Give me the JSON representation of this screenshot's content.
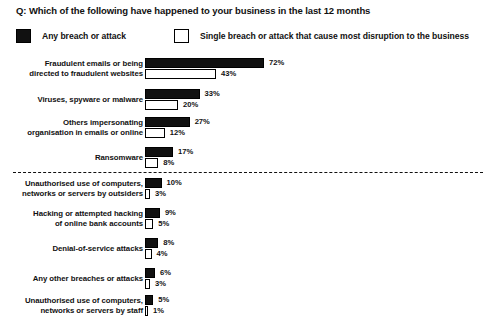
{
  "chart_data": {
    "type": "bar",
    "orientation": "horizontal",
    "title": "Q: Which of the following have happened to your business in the last 12 months",
    "xlabel": "",
    "ylabel": "",
    "xlim": [
      0,
      75
    ],
    "grid": false,
    "legend_position": "top",
    "value_suffix": "%",
    "legend": [
      {
        "label": "Any breach or attack",
        "swatch": "filled",
        "color": "#111111"
      },
      {
        "label": "Single breach or attack that cause most disruption to the business",
        "swatch": "hollow",
        "color": "#ffffff"
      }
    ],
    "series": [
      {
        "name": "Any breach or attack",
        "values": [
          72,
          33,
          27,
          17,
          10,
          9,
          8,
          6,
          5
        ],
        "value_labels": [
          "72%",
          "33%",
          "27%",
          "17%",
          "10%",
          "9%",
          "8%",
          "6%",
          "5%"
        ]
      },
      {
        "name": "Single breach or attack that cause most disruption to the business",
        "values": [
          43,
          20,
          12,
          8,
          3,
          5,
          4,
          3,
          1
        ],
        "value_labels": [
          "43%",
          "20%",
          "12%",
          "8%",
          "3%",
          "5%",
          "4%",
          "3%",
          "1%"
        ]
      }
    ],
    "categories": [
      "Fraudulent emails or being directed to fraudulent websites",
      "Viruses, spyware or malware",
      "Others impersonating organisation in emails or online",
      "Ransomware",
      "Unauthorised use of computers, networks or servers by outsiders",
      "Hacking or attempted hacking of online bank accounts",
      "Denial-of-service attacks",
      "Any other breaches or attacks",
      "Unauthorised use of computers, networks or servers by staff"
    ],
    "category_lines": [
      [
        "Fraudulent emails or being",
        "directed to fraudulent websites"
      ],
      [
        "Viruses, spyware or malware"
      ],
      [
        "Others impersonating",
        "organisation in emails or online"
      ],
      [
        "Ransomware"
      ],
      [
        "Unauthorised use of computers,",
        "networks or servers by outsiders"
      ],
      [
        "Hacking or attempted hacking",
        "of online bank accounts"
      ],
      [
        "Denial-of-service attacks"
      ],
      [
        "Any other breaches or attacks"
      ],
      [
        "Unauthorised use of computers,",
        "networks or servers by staff"
      ]
    ],
    "separator_after_category_index": 3,
    "separator_style": "dashed"
  }
}
